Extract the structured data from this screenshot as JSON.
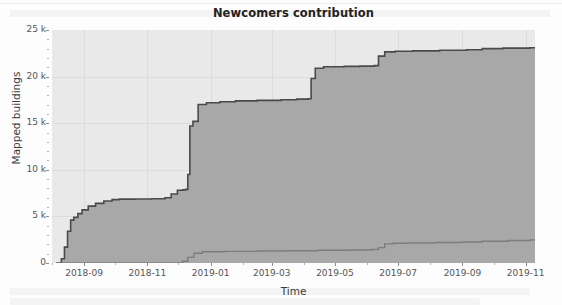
{
  "figure": {
    "title": "Newcomers contribution",
    "background_color": "#ffffff",
    "plot_background_color": "#e9e9e9",
    "grid_color": "#dcdcdc"
  },
  "axes": {
    "y_label": "Mapped buildings",
    "x_label": "Time",
    "y_ticks": [
      "0",
      "5 k",
      "10 k",
      "15 k",
      "20 k",
      "25 k"
    ],
    "y_tick_values": [
      0,
      5000,
      10000,
      15000,
      20000,
      25000
    ],
    "x_ticks": [
      "2018-09",
      "2018-11",
      "2019-01",
      "2019-03",
      "2019-05",
      "2019-07",
      "2019-09",
      "2019-11"
    ]
  },
  "chart_data": {
    "type": "area",
    "title": "Newcomers contribution",
    "xlabel": "Time",
    "ylabel": "Mapped buildings",
    "xlim": [
      "2018-08-01",
      "2019-11-10"
    ],
    "ylim": [
      0,
      25000
    ],
    "grid": true,
    "legend": "none",
    "x_tick_labels": [
      "2018-09",
      "2018-11",
      "2019-01",
      "2019-03",
      "2019-05",
      "2019-07",
      "2019-09",
      "2019-11"
    ],
    "y_tick_labels": [
      "0",
      "5 k",
      "10 k",
      "15 k",
      "20 k",
      "25 k"
    ],
    "fill_color": "#a8a8a8",
    "line_color": "#4a4a4a",
    "series": [
      {
        "name": "total mapped buildings",
        "line_color": "#4a4a4a",
        "fill_color": "#a8a8a8",
        "x": [
          "2018-08-05",
          "2018-08-10",
          "2018-08-13",
          "2018-08-16",
          "2018-08-19",
          "2018-08-22",
          "2018-08-26",
          "2018-08-30",
          "2018-09-05",
          "2018-09-12",
          "2018-09-20",
          "2018-09-28",
          "2018-10-05",
          "2018-10-20",
          "2018-11-05",
          "2018-11-18",
          "2018-11-24",
          "2018-11-30",
          "2018-12-05",
          "2018-12-08",
          "2018-12-10",
          "2018-12-12",
          "2018-12-15",
          "2018-12-20",
          "2018-12-28",
          "2019-01-10",
          "2019-01-25",
          "2019-02-15",
          "2019-03-10",
          "2019-03-25",
          "2019-04-05",
          "2019-04-08",
          "2019-04-12",
          "2019-04-20",
          "2019-05-10",
          "2019-05-25",
          "2019-06-08",
          "2019-06-12",
          "2019-06-18",
          "2019-06-28",
          "2019-07-15",
          "2019-08-10",
          "2019-09-05",
          "2019-09-20",
          "2019-10-10",
          "2019-11-05"
        ],
        "y": [
          0,
          450,
          1700,
          3400,
          4600,
          4900,
          5300,
          5700,
          6100,
          6400,
          6650,
          6800,
          6850,
          6870,
          6900,
          7000,
          7400,
          7800,
          7850,
          7900,
          9500,
          14700,
          15200,
          17000,
          17200,
          17300,
          17400,
          17450,
          17520,
          17580,
          17620,
          19800,
          20900,
          21050,
          21100,
          21120,
          21180,
          22200,
          22650,
          22720,
          22760,
          22820,
          22880,
          23000,
          23050,
          23100
        ]
      },
      {
        "name": "newcomers mapped buildings",
        "line_color": "#7d7d7d",
        "x": [
          "2018-08-05",
          "2018-11-28",
          "2018-12-05",
          "2018-12-10",
          "2018-12-16",
          "2018-12-24",
          "2019-01-15",
          "2019-02-15",
          "2019-03-15",
          "2019-04-15",
          "2019-05-15",
          "2019-06-05",
          "2019-06-12",
          "2019-06-18",
          "2019-06-26",
          "2019-07-10",
          "2019-08-05",
          "2019-09-01",
          "2019-09-20",
          "2019-10-15",
          "2019-11-05"
        ],
        "y": [
          0,
          0,
          180,
          600,
          1050,
          1200,
          1250,
          1290,
          1320,
          1360,
          1400,
          1450,
          1650,
          2050,
          2120,
          2150,
          2200,
          2250,
          2330,
          2420,
          2470
        ]
      }
    ]
  }
}
